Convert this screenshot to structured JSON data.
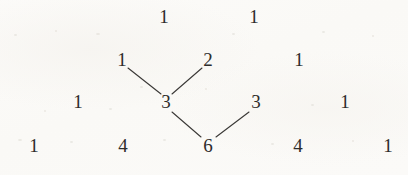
{
  "figure": {
    "background_color": "#fbfaf8",
    "text_color": "#2d2c2b",
    "line_color": "#3a3836"
  },
  "chart_data": {
    "type": "diagram",
    "nodes": [
      {
        "id": "r1c0",
        "label": "1",
        "row": 1,
        "col": 0,
        "x": 164,
        "y": 16
      },
      {
        "id": "r1c1",
        "label": "1",
        "row": 1,
        "col": 1,
        "x": 254,
        "y": 16
      },
      {
        "id": "r2c0",
        "label": "1",
        "row": 2,
        "col": 0,
        "x": 122,
        "y": 59
      },
      {
        "id": "r2c1",
        "label": "2",
        "row": 2,
        "col": 1,
        "x": 208,
        "y": 59
      },
      {
        "id": "r2c2",
        "label": "1",
        "row": 2,
        "col": 2,
        "x": 299,
        "y": 59
      },
      {
        "id": "r3c0",
        "label": "1",
        "row": 3,
        "col": 0,
        "x": 78,
        "y": 101
      },
      {
        "id": "r3c1",
        "label": "3",
        "row": 3,
        "col": 1,
        "x": 166,
        "y": 101
      },
      {
        "id": "r3c2",
        "label": "3",
        "row": 3,
        "col": 2,
        "x": 256,
        "y": 101
      },
      {
        "id": "r3c3",
        "label": "1",
        "row": 3,
        "col": 3,
        "x": 345,
        "y": 101
      },
      {
        "id": "r4c0",
        "label": "1",
        "row": 4,
        "col": 0,
        "x": 34,
        "y": 145
      },
      {
        "id": "r4c1",
        "label": "4",
        "row": 4,
        "col": 1,
        "x": 123,
        "y": 145
      },
      {
        "id": "r4c2",
        "label": "6",
        "row": 4,
        "col": 2,
        "x": 208,
        "y": 145
      },
      {
        "id": "r4c3",
        "label": "4",
        "row": 4,
        "col": 3,
        "x": 298,
        "y": 145
      },
      {
        "id": "r4c4",
        "label": "1",
        "row": 4,
        "col": 4,
        "x": 388,
        "y": 145
      }
    ],
    "edges": [
      {
        "id": "edge-1-to-3",
        "from": "r2c0",
        "to": "r3c1",
        "x1": 128,
        "y1": 68,
        "x2": 161,
        "y2": 94
      },
      {
        "id": "edge-2-to-3",
        "from": "r2c1",
        "to": "r3c1",
        "x1": 202,
        "y1": 68,
        "x2": 172,
        "y2": 94
      },
      {
        "id": "edge-3-to-6",
        "from": "r3c1",
        "to": "r4c2",
        "x1": 172,
        "y1": 112,
        "x2": 201,
        "y2": 137
      },
      {
        "id": "edge-3b-to-6",
        "from": "r3c2",
        "to": "r4c2",
        "x1": 249,
        "y1": 112,
        "x2": 216,
        "y2": 137
      }
    ],
    "rows": [
      {
        "row": 1,
        "values": [
          "1",
          "1"
        ]
      },
      {
        "row": 2,
        "values": [
          "1",
          "2",
          "1"
        ]
      },
      {
        "row": 3,
        "values": [
          "1",
          "3",
          "3",
          "1"
        ]
      },
      {
        "row": 4,
        "values": [
          "1",
          "4",
          "6",
          "4",
          "1"
        ]
      }
    ],
    "grid": false,
    "legend": null
  },
  "specks": [
    {
      "x": 14,
      "y": 34,
      "w": 3,
      "h": 2
    },
    {
      "x": 55,
      "y": 30,
      "w": 2,
      "h": 2
    },
    {
      "x": 96,
      "y": 33,
      "w": 4,
      "h": 2
    },
    {
      "x": 140,
      "y": 86,
      "w": 3,
      "h": 2
    },
    {
      "x": 232,
      "y": 33,
      "w": 3,
      "h": 2
    },
    {
      "x": 322,
      "y": 31,
      "w": 3,
      "h": 2
    },
    {
      "x": 372,
      "y": 35,
      "w": 2,
      "h": 2
    },
    {
      "x": 18,
      "y": 139,
      "w": 4,
      "h": 2
    },
    {
      "x": 70,
      "y": 141,
      "w": 3,
      "h": 2
    },
    {
      "x": 163,
      "y": 139,
      "w": 3,
      "h": 2
    },
    {
      "x": 271,
      "y": 143,
      "w": 3,
      "h": 2
    },
    {
      "x": 352,
      "y": 140,
      "w": 2,
      "h": 2
    },
    {
      "x": 44,
      "y": 110,
      "w": 2,
      "h": 2
    },
    {
      "x": 109,
      "y": 108,
      "w": 3,
      "h": 2
    },
    {
      "x": 311,
      "y": 104,
      "w": 3,
      "h": 2
    },
    {
      "x": 205,
      "y": 88,
      "w": 2,
      "h": 2
    }
  ]
}
